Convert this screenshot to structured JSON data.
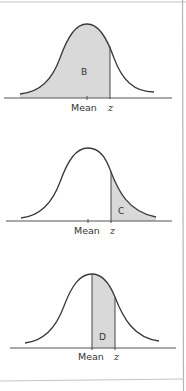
{
  "figure": {
    "border_color": "#b5b5b5",
    "curve_color": "#3a3a3a",
    "fill_color": "#d9d9d9",
    "axis_color": "#555555"
  },
  "panels": [
    {
      "name": "panel-b",
      "region_label": "B",
      "shaded": "left tail up to z",
      "axis_labels": {
        "mean": "Mean",
        "z": "z"
      }
    },
    {
      "name": "panel-c",
      "region_label": "C",
      "shaded": "right tail beyond z",
      "axis_labels": {
        "mean": "Mean",
        "z": "z"
      }
    },
    {
      "name": "panel-d",
      "region_label": "D",
      "shaded": "between mean and z",
      "axis_labels": {
        "mean": "Mean",
        "z": "z"
      }
    }
  ]
}
